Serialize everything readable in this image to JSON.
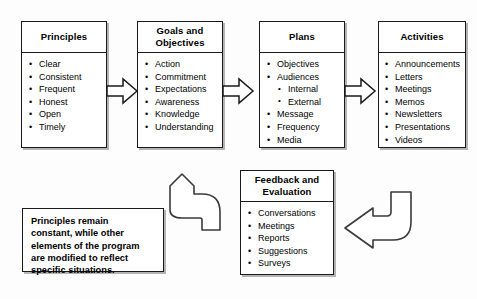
{
  "diagram": {
    "background_color": "#fdfdfd",
    "line_color": "#1a1a1a"
  },
  "boxes": [
    {
      "id": "principles",
      "header": "Principles",
      "items": [
        {
          "label": "Clear"
        },
        {
          "label": "Consistent"
        },
        {
          "label": "Frequent"
        },
        {
          "label": "Honest"
        },
        {
          "label": "Open"
        },
        {
          "label": "Timely"
        }
      ]
    },
    {
      "id": "goals",
      "header": "Goals and Objectives",
      "header_line1": "Goals and",
      "header_line2": "Objectives",
      "items": [
        {
          "label": "Action"
        },
        {
          "label": "Commitment"
        },
        {
          "label": "Expectations"
        },
        {
          "label": "Awareness"
        },
        {
          "label": "Knowledge"
        },
        {
          "label": "Understanding"
        }
      ]
    },
    {
      "id": "plans",
      "header": "Plans",
      "items": [
        {
          "label": "Objectives"
        },
        {
          "label": "Audiences",
          "sub": [
            {
              "label": "Internal"
            },
            {
              "label": "External"
            }
          ]
        },
        {
          "label": "Message"
        },
        {
          "label": "Frequency"
        },
        {
          "label": "Media"
        }
      ]
    },
    {
      "id": "activities",
      "header": "Activities",
      "items": [
        {
          "label": "Announcements"
        },
        {
          "label": "Letters"
        },
        {
          "label": "Meetings"
        },
        {
          "label": "Memos"
        },
        {
          "label": "Newsletters"
        },
        {
          "label": "Presentations"
        },
        {
          "label": "Videos"
        }
      ]
    },
    {
      "id": "feedback",
      "header": "Feedback and Evaluation",
      "header_line1": "Feedback and",
      "header_line2": "Evaluation",
      "items": [
        {
          "label": "Conversations"
        },
        {
          "label": "Meetings"
        },
        {
          "label": "Reports"
        },
        {
          "label": "Suggestions"
        },
        {
          "label": "Surveys"
        }
      ]
    }
  ],
  "note": {
    "id": "principles-note",
    "line1": "Principles remain",
    "line2": "constant, while other",
    "line3": "elements of the program",
    "line4": "are modified to reflect",
    "line5": "specific situations.",
    "text": "Principles remain constant, while other elements of the program are modified to reflect specific situations."
  },
  "connectors": [
    {
      "id": "principles-to-goals",
      "type": "block-arrow",
      "direction": "right"
    },
    {
      "id": "goals-to-plans",
      "type": "block-arrow",
      "direction": "right"
    },
    {
      "id": "plans-to-activities",
      "type": "block-arrow",
      "direction": "right"
    },
    {
      "id": "activities-to-feedback",
      "type": "elbow-arrow",
      "direction": "down-left"
    },
    {
      "id": "feedback-to-principles",
      "type": "elbow-arrow",
      "direction": "left-up"
    }
  ],
  "bullets": {
    "level1": "•",
    "level2": "•"
  }
}
